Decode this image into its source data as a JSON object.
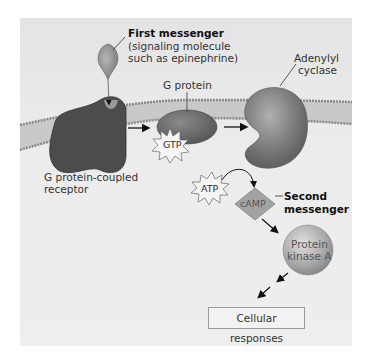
{
  "diagram": {
    "labels": {
      "first_messenger_title": "First messenger",
      "first_messenger_desc_1": "(signaling molecule",
      "first_messenger_desc_2": "such as epinephrine)",
      "g_protein": "G protein",
      "adenylyl_1": "Adenylyl",
      "adenylyl_2": "cyclase",
      "receptor_1": "G protein-coupled",
      "receptor_2": "receptor",
      "gtp": "GTP",
      "atp": "ATP",
      "camp": "cAMP",
      "second_messenger_1": "Second",
      "second_messenger_2": "messenger",
      "pka_1": "Protein",
      "pka_2": "kinase A",
      "cellular_responses": "Cellular responses"
    },
    "colors": {
      "background": "#ebebeb",
      "membrane": "#c8c8c8",
      "receptor": "#4a4a4a",
      "g_protein": "#6e6e6e",
      "adenylyl_cyclase": "#7d7d7d",
      "camp": "#a8a8a8",
      "pka": "#b5b5b5"
    },
    "flow": [
      "First messenger",
      "G protein-coupled receptor",
      "G protein",
      "Adenylyl cyclase",
      "ATP",
      "cAMP",
      "Protein kinase A",
      "Cellular responses"
    ]
  }
}
